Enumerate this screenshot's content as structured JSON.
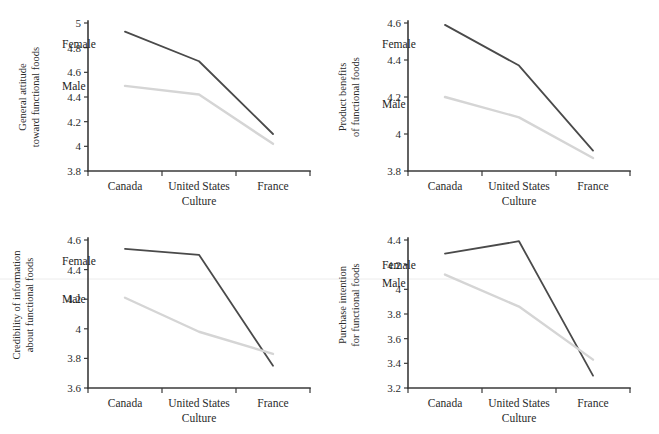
{
  "figure": {
    "type": "multi-panel-line-chart",
    "panel_count": 4,
    "xlabel": "Culture",
    "categories": [
      "Canada",
      "United States",
      "France"
    ],
    "series_names": [
      "Female",
      "Male"
    ],
    "colors": {
      "female": "#4a4a4a",
      "male": "#d5d5d5",
      "axis": "#3a3a3a",
      "text": "#2b2b2b",
      "background": "#ffffff"
    }
  },
  "chart_data": [
    {
      "type": "line",
      "panel": "top-left",
      "title": "",
      "ylabel": "General attitude toward functional foods",
      "ylabel_line1": "General attitude",
      "ylabel_line2": "toward functional foods",
      "xlabel": "Culture",
      "categories": [
        "Canada",
        "United States",
        "France"
      ],
      "ylim": [
        3.8,
        5.0
      ],
      "yticks": [
        "3.8",
        "4",
        "4.2",
        "4.4",
        "4.6",
        "4.8",
        "5"
      ],
      "ytick_values": [
        3.8,
        4.0,
        4.2,
        4.4,
        4.6,
        4.8,
        5.0
      ],
      "grid": false,
      "legend_position": "inline-labels",
      "series": [
        {
          "name": "Female",
          "values": [
            4.93,
            4.69,
            4.1
          ],
          "color": "#4a4a4a"
        },
        {
          "name": "Male",
          "values": [
            4.49,
            4.42,
            4.02
          ],
          "color": "#d5d5d5"
        }
      ]
    },
    {
      "type": "line",
      "panel": "top-right",
      "title": "",
      "ylabel": "Product benefits of functional foods",
      "ylabel_line1": "Product benefits",
      "ylabel_line2": "of functional foods",
      "xlabel": "Culture",
      "categories": [
        "Canada",
        "United States",
        "France"
      ],
      "ylim": [
        3.8,
        4.6
      ],
      "yticks": [
        "3.8",
        "4",
        "4.2",
        "4.4",
        "4.6"
      ],
      "ytick_values": [
        3.8,
        4.0,
        4.2,
        4.4,
        4.6
      ],
      "grid": false,
      "legend_position": "inline-labels",
      "series": [
        {
          "name": "Female",
          "values": [
            4.59,
            4.37,
            3.91
          ],
          "color": "#4a4a4a"
        },
        {
          "name": "Male",
          "values": [
            4.2,
            4.09,
            3.87
          ],
          "color": "#d5d5d5"
        }
      ]
    },
    {
      "type": "line",
      "panel": "bottom-left",
      "title": "",
      "ylabel": "Credibility of information about functional foods",
      "ylabel_line1": "Credibility of information",
      "ylabel_line2": "about functional foods",
      "xlabel": "Culture",
      "categories": [
        "Canada",
        "United States",
        "France"
      ],
      "ylim": [
        3.6,
        4.6
      ],
      "yticks": [
        "3.6",
        "3.8",
        "4",
        "4.2",
        "4.4",
        "4.6"
      ],
      "ytick_values": [
        3.6,
        3.8,
        4.0,
        4.2,
        4.4,
        4.6
      ],
      "grid": false,
      "legend_position": "inline-labels",
      "series": [
        {
          "name": "Female",
          "values": [
            4.54,
            4.5,
            3.75
          ],
          "color": "#4a4a4a"
        },
        {
          "name": "Male",
          "values": [
            4.21,
            3.98,
            3.83
          ],
          "color": "#d5d5d5"
        }
      ]
    },
    {
      "type": "line",
      "panel": "bottom-right",
      "title": "",
      "ylabel": "Purchase intention for functional foods",
      "ylabel_line1": "Purchase intention",
      "ylabel_line2": "for functional foods",
      "xlabel": "Culture",
      "categories": [
        "Canada",
        "United States",
        "France"
      ],
      "ylim": [
        3.2,
        4.4
      ],
      "yticks": [
        "3.2",
        "3.4",
        "3.6",
        "3.8",
        "4",
        "4.2",
        "4.4"
      ],
      "ytick_values": [
        3.2,
        3.4,
        3.6,
        3.8,
        4.0,
        4.2,
        4.4
      ],
      "grid": false,
      "legend_position": "inline-labels",
      "series": [
        {
          "name": "Female",
          "values": [
            4.29,
            4.39,
            3.3
          ],
          "color": "#4a4a4a"
        },
        {
          "name": "Male",
          "values": [
            4.12,
            3.86,
            3.43
          ],
          "color": "#d5d5d5"
        }
      ]
    }
  ]
}
